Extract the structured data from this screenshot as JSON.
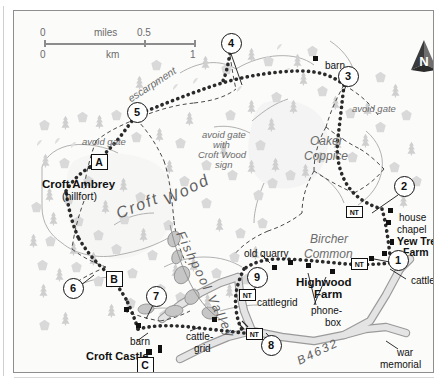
{
  "map": {
    "title": "Croft Castle and Croft Ambrey walking route map",
    "scale": {
      "miles_label": "miles",
      "miles_start": "0",
      "miles_end": "0.5",
      "km_label": "km",
      "km_start": "0",
      "km_end": "1"
    },
    "compass": {
      "label": "N",
      "name": "north-arrow"
    },
    "waypoints": [
      {
        "id": "1",
        "x": 383,
        "y": 248
      },
      {
        "id": "2",
        "x": 389,
        "y": 174
      },
      {
        "id": "3",
        "x": 333,
        "y": 64
      },
      {
        "id": "4",
        "x": 216,
        "y": 31
      },
      {
        "id": "5",
        "x": 122,
        "y": 100
      },
      {
        "id": "6",
        "x": 58,
        "y": 276
      },
      {
        "id": "7",
        "x": 141,
        "y": 284
      },
      {
        "id": "8",
        "x": 256,
        "y": 333
      },
      {
        "id": "9",
        "x": 242,
        "y": 265
      }
    ],
    "letter_markers": [
      {
        "id": "A",
        "x": 84,
        "y": 150
      },
      {
        "id": "B",
        "x": 99,
        "y": 267
      },
      {
        "id": "C",
        "x": 130,
        "y": 353
      }
    ],
    "nt_markers": [
      {
        "label": "NT",
        "x": 339,
        "y": 200
      },
      {
        "label": "NT",
        "x": 344,
        "y": 252
      },
      {
        "label": "NT",
        "x": 232,
        "y": 283
      },
      {
        "label": "NT",
        "x": 239,
        "y": 322
      }
    ],
    "place_labels": [
      {
        "text": "escarpment",
        "x": 112,
        "y": 84,
        "style": "grey-italic-rot",
        "rot": -33,
        "size": 10.5
      },
      {
        "text": "avoid gate",
        "x": 68,
        "y": 126,
        "style": "grey-italic",
        "size": 9.5
      },
      {
        "text": "avoid gate",
        "x": 188,
        "y": 119,
        "style": "grey-italic",
        "size": 9.5
      },
      {
        "text": "with",
        "x": 199,
        "y": 129,
        "style": "grey-italic",
        "size": 9.5
      },
      {
        "text": "Croft Wood",
        "x": 184,
        "y": 139,
        "style": "grey-italic",
        "size": 9.5
      },
      {
        "text": "sign",
        "x": 201,
        "y": 149,
        "style": "grey-italic",
        "size": 9.5
      },
      {
        "text": "avoid gate",
        "x": 338,
        "y": 93,
        "style": "grey-italic",
        "size": 9.5
      },
      {
        "text": "barn",
        "x": 311,
        "y": 50,
        "style": "plain",
        "size": 10
      },
      {
        "text": "barn",
        "x": 116,
        "y": 326,
        "style": "plain",
        "size": 10
      },
      {
        "text": "Oaker",
        "x": 296,
        "y": 124,
        "style": "grey-italic",
        "size": 12
      },
      {
        "text": "Coppice",
        "x": 290,
        "y": 139,
        "style": "grey-italic",
        "size": 12
      },
      {
        "text": "Bircher",
        "x": 296,
        "y": 222,
        "style": "grey-italic",
        "size": 12
      },
      {
        "text": "Common",
        "x": 290,
        "y": 237,
        "style": "grey-italic",
        "size": 12
      },
      {
        "text": "old quarry",
        "x": 230,
        "y": 238,
        "style": "plain",
        "size": 10
      },
      {
        "text": "Croft Ambrey",
        "x": 28,
        "y": 167,
        "style": "bold",
        "size": 11.5
      },
      {
        "text": "(hillfort)",
        "x": 48,
        "y": 180,
        "style": "plain",
        "size": 10.5
      },
      {
        "text": "Croft Castle",
        "x": 72,
        "y": 340,
        "style": "bold",
        "size": 11
      },
      {
        "text": "Highwood",
        "x": 282,
        "y": 265,
        "style": "bold",
        "size": 11.5
      },
      {
        "text": "Farm",
        "x": 300,
        "y": 277,
        "style": "bold",
        "size": 11.5
      },
      {
        "text": "Yew Tree",
        "x": 383,
        "y": 225,
        "style": "bold",
        "size": 10.5
      },
      {
        "text": "Farm",
        "x": 389,
        "y": 236,
        "style": "bold",
        "size": 10.5
      },
      {
        "text": "house",
        "x": 385,
        "y": 202,
        "style": "plain",
        "size": 10
      },
      {
        "text": "chapel",
        "x": 383,
        "y": 214,
        "style": "plain",
        "size": 10
      },
      {
        "text": "cattlegrid",
        "x": 397,
        "y": 265,
        "style": "plain",
        "size": 10
      },
      {
        "text": "cattlegrid",
        "x": 243,
        "y": 287,
        "style": "plain",
        "size": 10
      },
      {
        "text": "phone-",
        "x": 297,
        "y": 295,
        "style": "plain",
        "size": 10
      },
      {
        "text": "box",
        "x": 311,
        "y": 307,
        "style": "plain",
        "size": 10
      },
      {
        "text": "cattle-",
        "x": 172,
        "y": 321,
        "style": "plain",
        "size": 10
      },
      {
        "text": "grid",
        "x": 180,
        "y": 333,
        "style": "plain",
        "size": 10
      },
      {
        "text": "war",
        "x": 383,
        "y": 337,
        "style": "plain",
        "size": 10
      },
      {
        "text": "memorial",
        "x": 366,
        "y": 349,
        "style": "plain",
        "size": 10
      }
    ],
    "curved_labels": [
      {
        "text": "Croft",
        "x": 100,
        "y": 196,
        "rot": -22,
        "size": 16,
        "name": "croft-wood-label-part1"
      },
      {
        "text": "Wood",
        "x": 147,
        "y": 183,
        "rot": -27,
        "size": 16,
        "name": "croft-wood-label-part2"
      },
      {
        "text": "Fishpool Valley",
        "x": 172,
        "y": 218,
        "rot": 64,
        "size": 13,
        "name": "fishpool-valley-label"
      },
      {
        "text": "B4632",
        "x": 281,
        "y": 345,
        "rot": -26,
        "size": 12,
        "name": "road-b4632-label"
      }
    ]
  }
}
